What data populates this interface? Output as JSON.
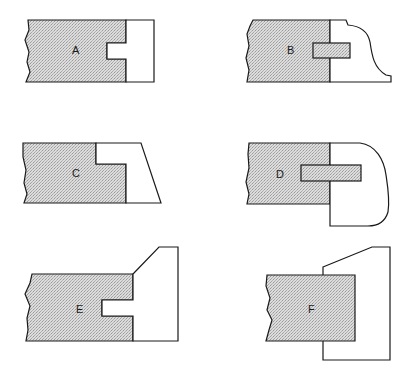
{
  "figure": {
    "type": "joint-profile-diagrams",
    "colors": {
      "shaded_fill": "#d9d9d9",
      "stroke": "#1a1a1a",
      "background": "#ffffff"
    },
    "panels": [
      {
        "id": "A",
        "label": "A",
        "description": "Shaded board with rectangular notch; white piece with matching tongue fitted into notch"
      },
      {
        "id": "B",
        "label": "B",
        "description": "Shaded board with shaded spline tongue into white piece with ogee curved edge"
      },
      {
        "id": "C",
        "label": "C",
        "description": "Shaded board with rabbeted step; white piece with slanted outer edge"
      },
      {
        "id": "D",
        "label": "D",
        "description": "Shaded board with long spline into white piece with rounded nose extending below"
      },
      {
        "id": "E",
        "label": "E",
        "description": "Shaded board with notch; taller white piece with beveled top extending above"
      },
      {
        "id": "F",
        "label": "F",
        "description": "Shaded board butted against taller white piece with angled top extending above and below"
      }
    ]
  }
}
